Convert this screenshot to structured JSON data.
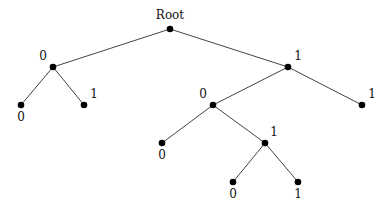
{
  "diagram": {
    "type": "binary-tree",
    "nodes": [
      {
        "id": "root",
        "label": "Root",
        "x": 170,
        "y": 29,
        "lx": 170,
        "ly": 19,
        "anchor": "middle"
      },
      {
        "id": "n0",
        "label": "0",
        "x": 53,
        "y": 67,
        "lx": 43,
        "ly": 60,
        "anchor": "middle"
      },
      {
        "id": "n00",
        "label": "0",
        "x": 21,
        "y": 105,
        "lx": 21,
        "ly": 121,
        "anchor": "middle"
      },
      {
        "id": "n01",
        "label": "1",
        "x": 84,
        "y": 105,
        "lx": 94,
        "ly": 98,
        "anchor": "middle"
      },
      {
        "id": "n1",
        "label": "1",
        "x": 288,
        "y": 67,
        "lx": 298,
        "ly": 60,
        "anchor": "middle"
      },
      {
        "id": "n10",
        "label": "0",
        "x": 213,
        "y": 105,
        "lx": 203,
        "ly": 98,
        "anchor": "middle"
      },
      {
        "id": "n11",
        "label": "1",
        "x": 362,
        "y": 105,
        "lx": 372,
        "ly": 98,
        "anchor": "middle"
      },
      {
        "id": "n100",
        "label": "0",
        "x": 162,
        "y": 143,
        "lx": 162,
        "ly": 159,
        "anchor": "middle"
      },
      {
        "id": "n101",
        "label": "1",
        "x": 265,
        "y": 143,
        "lx": 274,
        "ly": 136,
        "anchor": "middle"
      },
      {
        "id": "n1010",
        "label": "0",
        "x": 233,
        "y": 182,
        "lx": 233,
        "ly": 198,
        "anchor": "middle"
      },
      {
        "id": "n1011",
        "label": "1",
        "x": 298,
        "y": 182,
        "lx": 298,
        "ly": 198,
        "anchor": "middle"
      }
    ],
    "edges": [
      [
        "root",
        "n0"
      ],
      [
        "root",
        "n1"
      ],
      [
        "n0",
        "n00"
      ],
      [
        "n0",
        "n01"
      ],
      [
        "n1",
        "n10"
      ],
      [
        "n1",
        "n11"
      ],
      [
        "n10",
        "n100"
      ],
      [
        "n10",
        "n101"
      ],
      [
        "n101",
        "n1010"
      ],
      [
        "n101",
        "n1011"
      ]
    ]
  }
}
